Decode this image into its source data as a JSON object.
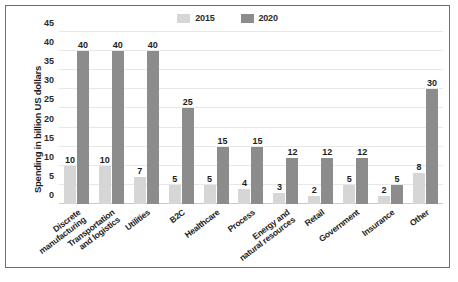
{
  "chart_data": {
    "type": "bar",
    "title": "",
    "xlabel": "",
    "ylabel": "Spending in billion US dollars",
    "ylim": [
      0,
      45
    ],
    "yticks": [
      0,
      5,
      10,
      15,
      20,
      25,
      30,
      35,
      40,
      45
    ],
    "grid": true,
    "legend_position": "top-center",
    "categories": [
      "Discrete\nmanufacturing",
      "Transportation\nand logistics",
      "Utilities",
      "B2C",
      "Healthcare",
      "Process",
      "Energy and\nnatural resources",
      "Retail",
      "Government",
      "Insurance",
      "Other"
    ],
    "series": [
      {
        "name": "2015",
        "color": "#d6d6d6",
        "values": [
          10,
          10,
          7,
          5,
          5,
          4,
          3,
          2,
          5,
          2,
          8
        ]
      },
      {
        "name": "2020",
        "color": "#8c8c8c",
        "values": [
          40,
          40,
          40,
          25,
          15,
          15,
          12,
          12,
          12,
          5,
          30
        ]
      }
    ]
  },
  "figure": {
    "border_color": "#6e6e6e",
    "background": "#ffffff",
    "gridline_color": "#e8e8e8"
  }
}
